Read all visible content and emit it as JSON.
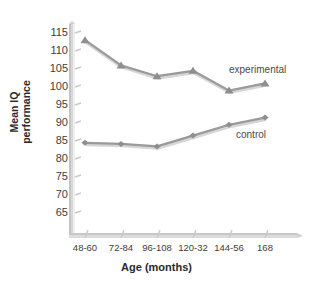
{
  "chart_data": {
    "type": "line",
    "title": "",
    "subtitle": "",
    "xlabel": "Age (months)",
    "ylabel": "Mean IQ performance",
    "ylabel_lines": [
      "Mean IQ",
      "performance"
    ],
    "categories": [
      "48-60",
      "72-84",
      "96-108",
      "120-32",
      "144-56",
      "168"
    ],
    "ylim": [
      65,
      115
    ],
    "yticks": [
      115,
      110,
      105,
      100,
      95,
      90,
      85,
      80,
      75,
      70,
      65
    ],
    "ytick_labels": [
      "115",
      "110",
      "105",
      "100",
      "95",
      "90",
      "85",
      "80",
      "75",
      "70",
      "65"
    ],
    "grid": false,
    "legend_position": "inline-right",
    "series": [
      {
        "name": "experimental",
        "label": "experimental",
        "marker": "triangle",
        "color": "#9a9a9a",
        "values": [
          113,
          106,
          103,
          104.5,
          99,
          101
        ]
      },
      {
        "name": "control",
        "label": "control",
        "marker": "diamond",
        "color": "#9a9a9a",
        "values": [
          84.5,
          84.2,
          83.5,
          86.5,
          89.5,
          91.5
        ]
      }
    ]
  },
  "colors": {
    "line": "#9a9a9a",
    "marker": "#8e8e8e",
    "axis": "#b9b9b9",
    "axis_shadow": "#d8d8d8",
    "text": "#3d3d3d",
    "title_text": "#2a2a2a",
    "background": "#ffffff"
  },
  "axes": {
    "x_axis_title": "Age (months)",
    "y_axis_title": "Mean IQ performance"
  },
  "labels": {
    "experimental": "experimental",
    "control": "control"
  }
}
